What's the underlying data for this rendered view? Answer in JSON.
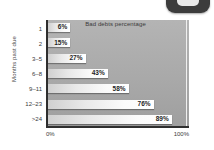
{
  "corner_graphic": {
    "name": "rounded-badge",
    "body_color": "#3c3c3c",
    "pill_color": "#e9e9e9"
  },
  "chart_data": {
    "type": "bar",
    "orientation": "horizontal",
    "title": "Bad debts percentage",
    "xlabel": "",
    "ylabel": "Months past due",
    "categories": [
      "1",
      "2",
      "3–5",
      "6–8",
      "9–11",
      "12–23",
      ">24"
    ],
    "values": [
      6,
      15,
      27,
      43,
      58,
      76,
      89
    ],
    "value_labels": [
      "6%",
      "15%",
      "27%",
      "43%",
      "58%",
      "76%",
      "89%"
    ],
    "xlim": [
      0,
      100
    ],
    "x_tick_labels": [
      "0%",
      "100%"
    ],
    "grid": false,
    "legend": "none",
    "colors": {
      "plot_background": "#ababab",
      "bar_fill_start": "#d0d0d0",
      "bar_fill_end": "#ffffff",
      "axis_line": "#2f2f2f",
      "text": "#3b3b3b",
      "page_background": "#ffffff"
    }
  }
}
